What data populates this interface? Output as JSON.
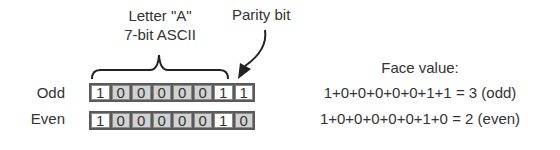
{
  "header": {
    "letter_label": "Letter \"A\"",
    "ascii_label": "7-bit ASCII",
    "parity_label": "Parity bit"
  },
  "rows": [
    {
      "label": "Odd",
      "bits": [
        "1",
        "0",
        "0",
        "0",
        "0",
        "0",
        "1",
        "1"
      ],
      "face_value": "1+0+0+0+0+0+1+1 = 3 (odd)"
    },
    {
      "label": "Even",
      "bits": [
        "1",
        "0",
        "0",
        "0",
        "0",
        "0",
        "1",
        "0"
      ],
      "face_value": "1+0+0+0+0+0+1+0 = 2 (even)"
    }
  ],
  "face_value_heading": "Face value:",
  "colors": {
    "text": "#333333",
    "bit_zero_fill": "#d2d2d2",
    "bit_one_fill": "#ffffff",
    "bit_border": "#5a5a5a"
  }
}
